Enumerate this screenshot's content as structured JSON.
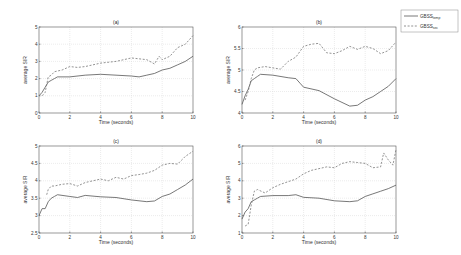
{
  "legend": {
    "entries": [
      {
        "name": "GBSS",
        "sub": "temp",
        "style": "solid"
      },
      {
        "name": "GBSS",
        "sub": "sec",
        "style": "dashed"
      }
    ]
  },
  "chart_data": [
    {
      "type": "line",
      "title": "(a)",
      "xlabel": "Time (seconds)",
      "ylabel": "average SIR",
      "xlim": [
        0,
        10
      ],
      "ylim": [
        0,
        5
      ],
      "xticks": [
        0,
        2,
        4,
        6,
        8,
        10
      ],
      "yticks": [
        0,
        1,
        2,
        3,
        4,
        5
      ],
      "grid": true,
      "series": [
        {
          "name": "GBSS_temp",
          "x": [
            0,
            0.2,
            0.4,
            0.6,
            0.8,
            1.0,
            1.2,
            2,
            3,
            4,
            5,
            6,
            6.5,
            7,
            7.5,
            8,
            8.5,
            9,
            9.5,
            10
          ],
          "values": [
            1.0,
            1.2,
            1.5,
            1.8,
            1.9,
            2.0,
            2.1,
            2.1,
            2.2,
            2.25,
            2.2,
            2.15,
            2.1,
            2.2,
            2.3,
            2.5,
            2.6,
            2.8,
            3.0,
            3.3
          ]
        },
        {
          "name": "GBSS_sec",
          "x": [
            0.2,
            0.4,
            0.6,
            0.8,
            1.0,
            1.5,
            2,
            2.5,
            3,
            4,
            5,
            6,
            7,
            7.5,
            7.8,
            8,
            8.5,
            9,
            9.5,
            10
          ],
          "values": [
            1.0,
            1.2,
            2.1,
            2.2,
            2.4,
            2.5,
            2.7,
            2.65,
            2.7,
            2.9,
            3.0,
            3.2,
            3.1,
            2.85,
            3.3,
            3.1,
            3.3,
            3.8,
            4.0,
            4.5
          ]
        }
      ]
    },
    {
      "type": "line",
      "title": "(b)",
      "xlabel": "Time (seconds)",
      "ylabel": "average SIR",
      "xlim": [
        0,
        10
      ],
      "ylim": [
        4,
        6
      ],
      "xticks": [
        0,
        2,
        4,
        6,
        8,
        10
      ],
      "yticks": [
        4,
        4.5,
        5,
        5.5,
        6
      ],
      "grid": true,
      "series": [
        {
          "name": "GBSS_temp",
          "x": [
            0,
            0.2,
            0.4,
            0.6,
            0.8,
            1.0,
            1.2,
            2,
            3,
            3.5,
            3.8,
            4,
            5,
            6,
            7,
            7.5,
            8,
            8.5,
            9,
            9.5,
            10
          ],
          "values": [
            4.2,
            4.4,
            4.55,
            4.75,
            4.8,
            4.85,
            4.9,
            4.88,
            4.82,
            4.8,
            4.68,
            4.6,
            4.52,
            4.33,
            4.16,
            4.18,
            4.3,
            4.38,
            4.5,
            4.62,
            4.8
          ]
        },
        {
          "name": "GBSS_sec",
          "x": [
            0.2,
            0.4,
            0.6,
            0.8,
            1.0,
            1.5,
            2,
            2.5,
            3,
            3.5,
            4,
            4.5,
            5,
            5.5,
            6,
            6.5,
            7,
            7.5,
            8,
            8.5,
            9,
            9.5,
            10
          ],
          "values": [
            4.3,
            4.5,
            4.8,
            5.0,
            5.05,
            5.08,
            5.05,
            5.02,
            5.2,
            5.3,
            5.55,
            5.6,
            5.62,
            5.4,
            5.38,
            5.45,
            5.55,
            5.48,
            5.55,
            5.5,
            5.38,
            5.45,
            5.65
          ]
        }
      ]
    },
    {
      "type": "line",
      "title": "(c)",
      "xlabel": "Time (seconds)",
      "ylabel": "average SIR",
      "xlim": [
        0,
        10
      ],
      "ylim": [
        2.5,
        5
      ],
      "xticks": [
        0,
        2,
        4,
        6,
        8,
        10
      ],
      "yticks": [
        2.5,
        3,
        3.5,
        4,
        4.5,
        5
      ],
      "grid": true,
      "series": [
        {
          "name": "GBSS_temp",
          "x": [
            0,
            0.2,
            0.4,
            0.6,
            0.8,
            1.0,
            1.2,
            2,
            2.5,
            3,
            4,
            5,
            6,
            7,
            7.5,
            8,
            8.5,
            9,
            9.5,
            10
          ],
          "values": [
            3.0,
            3.2,
            3.2,
            3.4,
            3.5,
            3.55,
            3.6,
            3.55,
            3.52,
            3.58,
            3.54,
            3.52,
            3.45,
            3.4,
            3.42,
            3.55,
            3.62,
            3.75,
            3.88,
            4.05
          ]
        },
        {
          "name": "GBSS_sec",
          "x": [
            0.5,
            0.6,
            0.8,
            1.0,
            1.5,
            2,
            2.5,
            3,
            3.5,
            4,
            4.5,
            5,
            5.5,
            6,
            6.5,
            7,
            7.5,
            8,
            8.5,
            9,
            9.5,
            10
          ],
          "values": [
            3.6,
            3.75,
            3.85,
            3.85,
            3.9,
            3.92,
            3.85,
            3.95,
            4.0,
            4.05,
            4.0,
            4.1,
            4.05,
            4.15,
            4.18,
            4.22,
            4.3,
            4.45,
            4.5,
            4.48,
            4.7,
            4.85
          ]
        }
      ]
    },
    {
      "type": "line",
      "title": "(d)",
      "xlabel": "Time (seconds)",
      "ylabel": "average SIR",
      "xlim": [
        0,
        10
      ],
      "ylim": [
        1,
        6
      ],
      "xticks": [
        0,
        2,
        4,
        6,
        8,
        10
      ],
      "yticks": [
        1,
        2,
        3,
        4,
        5,
        6
      ],
      "grid": true,
      "series": [
        {
          "name": "GBSS_temp",
          "x": [
            0,
            0.2,
            0.4,
            0.6,
            0.8,
            1.0,
            1.2,
            2,
            3,
            3.5,
            4,
            5,
            6,
            7,
            7.5,
            8,
            8.5,
            9,
            9.5,
            10
          ],
          "values": [
            1.8,
            2.2,
            2.4,
            2.8,
            2.9,
            3.0,
            3.1,
            3.15,
            3.15,
            3.2,
            3.05,
            3.0,
            2.85,
            2.8,
            2.85,
            3.1,
            3.25,
            3.4,
            3.55,
            3.75
          ]
        },
        {
          "name": "GBSS_sec",
          "x": [
            0.2,
            0.4,
            0.6,
            0.8,
            1.0,
            1.5,
            2,
            2.5,
            3,
            3.5,
            4,
            4.5,
            5,
            5.5,
            6,
            6.5,
            7,
            7.5,
            8,
            8.5,
            9,
            9.2,
            9.5,
            9.8,
            10
          ],
          "values": [
            1.4,
            1.5,
            2.6,
            3.4,
            3.5,
            3.3,
            3.6,
            3.8,
            3.95,
            4.1,
            4.4,
            4.6,
            4.7,
            4.8,
            4.75,
            5.0,
            5.1,
            5.05,
            5.0,
            4.75,
            4.8,
            5.6,
            5.2,
            4.9,
            5.8
          ]
        }
      ]
    }
  ]
}
